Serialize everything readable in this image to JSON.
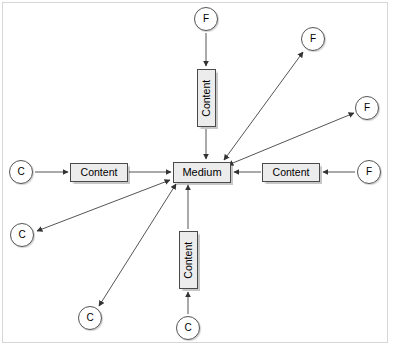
{
  "diagram": {
    "type": "node-link",
    "background": "#ffffff",
    "frame_color": "#d6d6d6",
    "node_fill": "#ececec",
    "circle_fill": "#ffffff",
    "stroke_color": "#555555",
    "hub": {
      "label": "Medium",
      "x": 202,
      "y": 172
    },
    "nodes": [
      {
        "id": "c-left",
        "kind": "circle",
        "label": "C",
        "x": 21,
        "y": 172
      },
      {
        "id": "content-left",
        "kind": "box-h",
        "label": "Content",
        "x": 99,
        "y": 172
      },
      {
        "id": "f-right",
        "kind": "circle",
        "label": "F",
        "x": 369,
        "y": 172
      },
      {
        "id": "content-right",
        "kind": "box-h",
        "label": "Content",
        "x": 291,
        "y": 172
      },
      {
        "id": "f-top",
        "kind": "circle",
        "label": "F",
        "x": 206,
        "y": 19
      },
      {
        "id": "content-top",
        "kind": "box-v",
        "label": "Content",
        "x": 206,
        "y": 98
      },
      {
        "id": "c-bottom",
        "kind": "circle",
        "label": "C",
        "x": 188,
        "y": 328
      },
      {
        "id": "content-bottom",
        "kind": "box-v",
        "label": "Content",
        "x": 188,
        "y": 260
      },
      {
        "id": "f-upper-right",
        "kind": "circle",
        "label": "F",
        "x": 313,
        "y": 39
      },
      {
        "id": "f-far-right",
        "kind": "circle",
        "label": "F",
        "x": 367,
        "y": 108
      },
      {
        "id": "c-lower-left",
        "kind": "circle",
        "label": "C",
        "x": 22,
        "y": 235
      },
      {
        "id": "c-bottom-left",
        "kind": "circle",
        "label": "C",
        "x": 90,
        "y": 318
      }
    ],
    "edges": [
      {
        "id": "e1",
        "from": "c-left",
        "to": "content-left",
        "direction": "one-way"
      },
      {
        "id": "e2",
        "from": "content-left",
        "to": "hub",
        "direction": "one-way"
      },
      {
        "id": "e3",
        "from": "f-right",
        "to": "content-right",
        "direction": "one-way"
      },
      {
        "id": "e4",
        "from": "content-right",
        "to": "hub",
        "direction": "one-way"
      },
      {
        "id": "e5",
        "from": "f-top",
        "to": "content-top",
        "direction": "one-way"
      },
      {
        "id": "e6",
        "from": "content-top",
        "to": "hub",
        "direction": "one-way"
      },
      {
        "id": "e7",
        "from": "c-bottom",
        "to": "content-bottom",
        "direction": "one-way"
      },
      {
        "id": "e8",
        "from": "content-bottom",
        "to": "hub",
        "direction": "one-way"
      },
      {
        "id": "e9",
        "from": "hub",
        "to": "f-upper-right",
        "direction": "two-way"
      },
      {
        "id": "e10",
        "from": "hub",
        "to": "f-far-right",
        "direction": "two-way"
      },
      {
        "id": "e11",
        "from": "hub",
        "to": "c-lower-left",
        "direction": "two-way"
      },
      {
        "id": "e12",
        "from": "hub",
        "to": "c-bottom-left",
        "direction": "two-way"
      }
    ]
  }
}
